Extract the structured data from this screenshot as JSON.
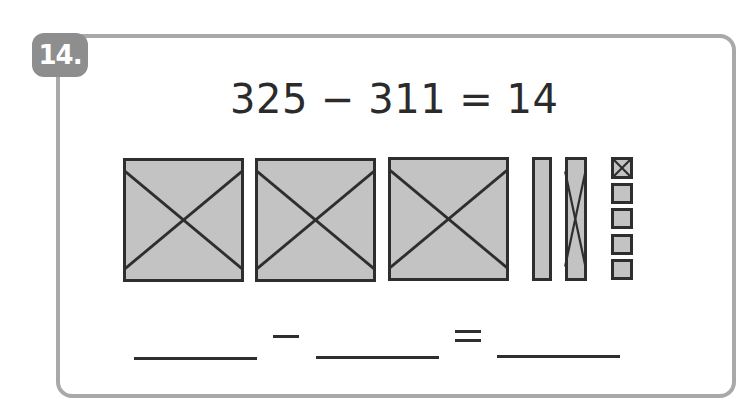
{
  "problem": {
    "number": "14.",
    "equation": "325 − 311 = 14",
    "minuend": 325,
    "subtrahend": 311,
    "difference": 14
  },
  "base_ten_blocks": {
    "hundreds": [
      {
        "crossed": true
      },
      {
        "crossed": true
      },
      {
        "crossed": true
      }
    ],
    "tens": [
      {
        "crossed": false
      },
      {
        "crossed": true
      }
    ],
    "ones": [
      {
        "crossed": true
      },
      {
        "crossed": false
      },
      {
        "crossed": false
      },
      {
        "crossed": false
      },
      {
        "crossed": false
      }
    ]
  },
  "answer_line": {
    "blank_1": "",
    "operator": "−",
    "blank_2": "",
    "equals": "=",
    "blank_3": ""
  },
  "colors": {
    "block_fill": "#c3c3c3",
    "stroke": "#2e2e2e",
    "border": "#a9a9a9",
    "badge": "#8e8e8e"
  }
}
